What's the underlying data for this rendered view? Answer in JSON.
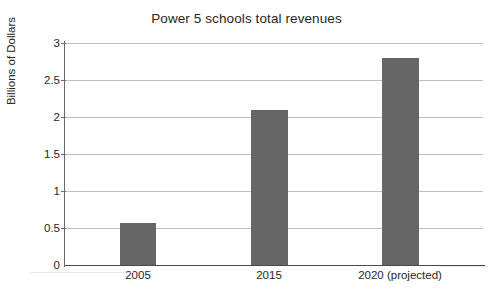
{
  "chart_data": {
    "type": "bar",
    "title": "Power 5 schools total revenues",
    "xlabel": "",
    "ylabel": "Billions of Dollars",
    "categories": [
      "2005",
      "2015",
      "2020 (projected)"
    ],
    "values": [
      0.57,
      2.1,
      2.8
    ],
    "series": [
      {
        "name": "Total revenues",
        "values": [
          0.57,
          2.1,
          2.8
        ]
      }
    ],
    "ylim": [
      0,
      3
    ],
    "ytick_labels": [
      "0",
      "0.5",
      "1",
      "1.5",
      "2",
      "2.5",
      "3"
    ],
    "ytick_values": [
      0,
      0.5,
      1,
      1.5,
      2,
      2.5,
      3
    ],
    "grid": true,
    "legend": false,
    "bar_color": "#666666",
    "gridline_color": "#bfbfbf",
    "axis_color": "#4a4a4a",
    "background_color": "#ffffff"
  }
}
